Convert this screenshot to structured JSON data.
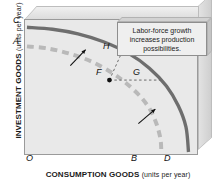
{
  "figure": {
    "callout": {
      "text": "Labor-force growth increases production possibilities."
    }
  },
  "chart_data": {
    "type": "line",
    "title": "",
    "subtitle": "",
    "xlabel_bold": "CONSUMPTION GOODS",
    "xlabel_light": "(units per year)",
    "ylabel_bold": "INVESTMENT GOODS",
    "ylabel_light": "(units per year)",
    "grid": false,
    "legend": "none",
    "xlim": [
      0,
      1
    ],
    "ylim": [
      0,
      1
    ],
    "axis_tick_labels": {
      "origin": "O",
      "x_inner_intercept": "B",
      "x_outer_intercept": "D",
      "y_outer_intercept": "C",
      "y_inner_intercept": "A"
    },
    "series": [
      {
        "name": "Original production possibilities frontier",
        "style": "dashed",
        "color": "#b9b9b9",
        "y_intercept_label": "A",
        "x_intercept_label": "B",
        "points": [
          {
            "x": 0.0,
            "y": 0.8
          },
          {
            "x": 0.12,
            "y": 0.785
          },
          {
            "x": 0.25,
            "y": 0.745
          },
          {
            "x": 0.38,
            "y": 0.685
          },
          {
            "x": 0.5,
            "y": 0.6
          },
          {
            "x": 0.58,
            "y": 0.525
          },
          {
            "x": 0.66,
            "y": 0.43
          },
          {
            "x": 0.72,
            "y": 0.33
          },
          {
            "x": 0.76,
            "y": 0.22
          },
          {
            "x": 0.785,
            "y": 0.1
          },
          {
            "x": 0.79,
            "y": 0.0
          }
        ]
      },
      {
        "name": "New production possibilities frontier after labor-force growth",
        "style": "solid",
        "color": "#6e6e6e",
        "y_intercept_label": "C",
        "x_intercept_label": "D",
        "points": [
          {
            "x": 0.0,
            "y": 0.945
          },
          {
            "x": 0.15,
            "y": 0.93
          },
          {
            "x": 0.3,
            "y": 0.895
          },
          {
            "x": 0.45,
            "y": 0.835
          },
          {
            "x": 0.6,
            "y": 0.745
          },
          {
            "x": 0.72,
            "y": 0.635
          },
          {
            "x": 0.82,
            "y": 0.5
          },
          {
            "x": 0.89,
            "y": 0.35
          },
          {
            "x": 0.935,
            "y": 0.19
          },
          {
            "x": 0.95,
            "y": 0.0
          }
        ]
      }
    ],
    "annotated_points": [
      {
        "label": "F",
        "x": 0.485,
        "y": 0.545,
        "marker": "filled-dot",
        "label_side": "left"
      },
      {
        "label": "G",
        "x": 0.79,
        "y": 0.545,
        "marker": "none",
        "label_side": "right"
      },
      {
        "label": "H",
        "x": 0.565,
        "y": 0.775,
        "marker": "none",
        "label_side": "right"
      }
    ],
    "guide_lines": [
      {
        "from": "F",
        "to": "G",
        "orientation": "horizontal",
        "style": "dashed"
      },
      {
        "from": "F",
        "to": "H",
        "orientation": "vertical",
        "style": "dashed"
      }
    ],
    "arrows": [
      {
        "name": "upper-shift-arrow",
        "x1": 0.255,
        "y1": 0.655,
        "x2": 0.345,
        "y2": 0.775
      },
      {
        "name": "lower-shift-arrow",
        "x1": 0.655,
        "y1": 0.215,
        "x2": 0.755,
        "y2": 0.325
      }
    ],
    "annotations": [
      {
        "name": "callout",
        "text": "Labor-force growth increases production possibilities."
      }
    ]
  }
}
